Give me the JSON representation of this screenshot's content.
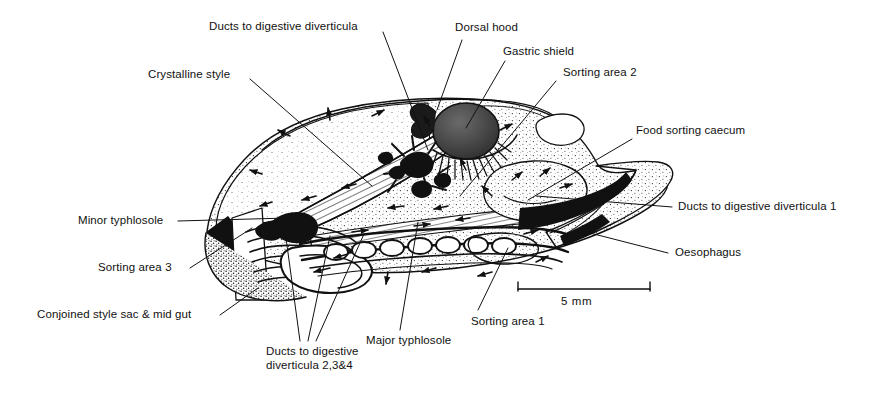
{
  "figure": {
    "ink_color": "#111111",
    "background_color": "#ffffff",
    "width": 895,
    "height": 396
  },
  "labels": [
    {
      "id": "ducts-digestive-diverticula",
      "text": "Ducts to digestive diverticula"
    },
    {
      "id": "crystalline-style",
      "text": "Crystalline style"
    },
    {
      "id": "dorsal-hood",
      "text": "Dorsal hood"
    },
    {
      "id": "gastric-shield",
      "text": "Gastric shield"
    },
    {
      "id": "sorting-area-2",
      "text": "Sorting area 2"
    },
    {
      "id": "food-sorting-caecum",
      "text": "Food sorting caecum"
    },
    {
      "id": "ducts-digestive-diverticula-1",
      "text": "Ducts to digestive diverticula 1"
    },
    {
      "id": "oesophagus",
      "text": "Oesophagus"
    },
    {
      "id": "minor-typhlosole",
      "text": "Minor typhlosole"
    },
    {
      "id": "sorting-area-3",
      "text": "Sorting area 3"
    },
    {
      "id": "conjoined-style-sac-mid-gut",
      "text": "Conjoined style sac & mid gut"
    },
    {
      "id": "ducts-digestive-diverticula-234-line1",
      "text": "Ducts to digestive"
    },
    {
      "id": "ducts-digestive-diverticula-234-line2",
      "text": "diverticula 2,3&4"
    },
    {
      "id": "major-typhlosole",
      "text": "Major typhlosole"
    },
    {
      "id": "sorting-area-1",
      "text": "Sorting area 1"
    }
  ],
  "scale_bar": {
    "caption": "5 mm",
    "length_mm": 5
  }
}
